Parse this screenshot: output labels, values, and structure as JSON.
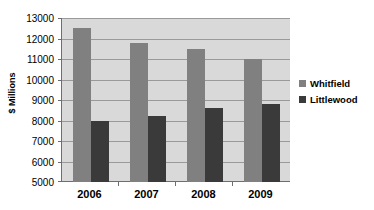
{
  "chart_data": {
    "type": "bar",
    "title": "",
    "subtitle": "",
    "xlabel": "",
    "ylabel": "$ Millions",
    "categories": [
      "2006",
      "2007",
      "2008",
      "2009"
    ],
    "series": [
      {
        "name": "Whitfield",
        "color": "#808080",
        "values": [
          12500,
          11800,
          11500,
          11000
        ]
      },
      {
        "name": "Littlewood",
        "color": "#3a3a3a",
        "values": [
          8000,
          8200,
          8600,
          8800
        ]
      }
    ],
    "ylim": [
      5000,
      13000
    ],
    "ytick_step": 1000,
    "yticks": [
      13000,
      12000,
      11000,
      10000,
      9000,
      8000,
      7000,
      6000,
      5000
    ],
    "ytick_labels": [
      "13000",
      "12000",
      "11000",
      "10000",
      "9000",
      "8000",
      "7000",
      "6000",
      "5000"
    ],
    "grid": true,
    "grid_axis": "y",
    "legend_position": "right",
    "plot_background": "#d9d9d9",
    "figure_background": "#ffffff",
    "axis_color": "#6e6e6e",
    "gridline_color": "#9a9a9a"
  },
  "legend": {
    "entries": [
      {
        "label": "Whitfield",
        "swatch_icon": "legend-swatch-icon"
      },
      {
        "label": "Littlewood",
        "swatch_icon": "legend-swatch-icon"
      }
    ]
  }
}
